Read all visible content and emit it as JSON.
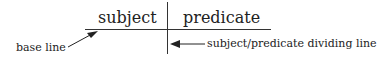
{
  "diagram": {
    "subject": "subject",
    "predicate": "predicate",
    "base_line_label": "base line",
    "divider_label": "subject/predicate dividing line"
  }
}
